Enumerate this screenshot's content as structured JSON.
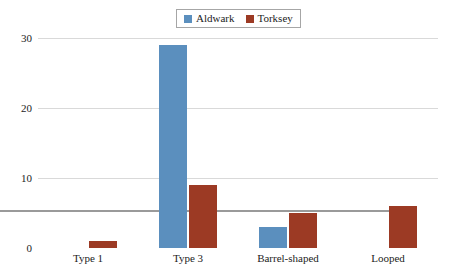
{
  "chart_data": {
    "type": "bar",
    "title": "",
    "subtitle": "",
    "xlabel": "",
    "ylabel": "",
    "categories": [
      "Type 1",
      "Type 3",
      "Barrel-shaped",
      "Looped"
    ],
    "series": [
      {
        "name": "Aldwark",
        "color": "#5b8fbe",
        "values": [
          0,
          29,
          3,
          0
        ]
      },
      {
        "name": "Torksey",
        "color": "#9c3a24",
        "values": [
          1,
          9,
          5,
          6
        ]
      }
    ],
    "ylim": [
      0,
      30
    ],
    "yticks": [
      0,
      10,
      20,
      30
    ],
    "ytick_labels": [
      "0",
      "10",
      "20",
      "30"
    ],
    "grid": true,
    "grid_axis": "y",
    "legend_position": "top-center",
    "legend_entries": [
      "Aldwark",
      "Torksey"
    ],
    "bar_mode": "grouped"
  },
  "legend": {
    "items": [
      {
        "label": "Aldwark",
        "swatch_name": "legend-swatch-aldwark"
      },
      {
        "label": "Torksey",
        "swatch_name": "legend-swatch-torksey"
      }
    ]
  },
  "axes": {
    "y": {
      "tick_labels": [
        "30",
        "20",
        "10",
        "0"
      ]
    },
    "x": {
      "tick_labels": [
        "Type 1",
        "Type 3",
        "Barrel-shaped",
        "Looped"
      ]
    }
  },
  "colors": {
    "series_aldwark": "#5b8fbe",
    "series_torksey": "#9c3a24",
    "gridline": "#d9d9d9",
    "axis": "#9a9a9a",
    "text": "#1c1c1c",
    "background": "#ffffff"
  }
}
